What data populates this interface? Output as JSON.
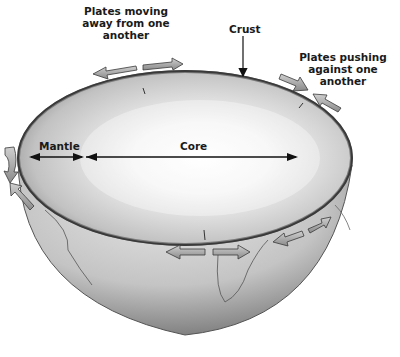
{
  "diagram": {
    "labels": {
      "plates_apart": [
        "Plates moving",
        "away from one",
        "another"
      ],
      "crust": "Crust",
      "plates_pushing": [
        "Plates pushing",
        "against one",
        "another"
      ],
      "mantle": "Mantle",
      "core": "Core"
    },
    "colors": {
      "background": "#ffffff",
      "text": "#1a1a1a",
      "shell_dark": "#6e6e6e",
      "shell_light": "#d8d8d8",
      "core_light": "#ffffff",
      "arrow_fill": "#a8a8a8",
      "arrow_stroke": "#3a3a3a"
    }
  }
}
